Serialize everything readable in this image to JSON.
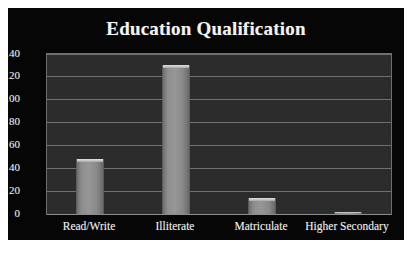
{
  "chart_data": {
    "type": "bar",
    "title": "Education Qualification",
    "xlabel": "",
    "ylabel": "",
    "categories": [
      "Read/Write",
      "Illiterate",
      "Matriculate",
      "Higher Secondary"
    ],
    "values": [
      48,
      130,
      14,
      1
    ],
    "ylim": [
      0,
      140
    ],
    "yticks": [
      0,
      20,
      40,
      60,
      80,
      100,
      120,
      140
    ],
    "ytick_labels": [
      "0",
      "20",
      "40",
      "60",
      "80",
      "100",
      "120",
      "140"
    ],
    "grid": true,
    "legend": null,
    "legend_position": "none",
    "series": [
      {
        "name": "Education Qualification",
        "values": [
          48,
          130,
          14,
          1
        ]
      }
    ],
    "colors": {
      "figure_background": "#ffffff",
      "panel_background": "#060606",
      "plot_background": "#2b2b2b",
      "gridline": "#7d7d7d",
      "bar_fill": "#8e8e8e",
      "bar_highlight": "#e2e2e2",
      "text": "#efefef",
      "title_text": "#f2f2f2",
      "plot_border": "#6f6f6f"
    }
  },
  "figure": {
    "title": "Education Qualification",
    "caption_sliver": ""
  }
}
